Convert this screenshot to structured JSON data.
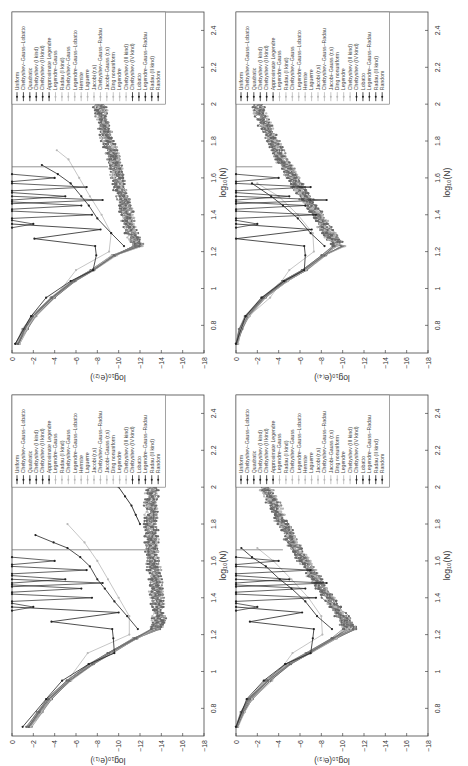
{
  "figure": {
    "orientation": "rotated-90-ccw",
    "panels_layout": "2x2"
  },
  "chart_data": [
    {
      "type": "line",
      "panel": "top-left",
      "title": "",
      "xlabel": "log10(N)",
      "ylabel": "log10(e_(2))",
      "xlim": [
        0.65,
        2.5
      ],
      "ylim": [
        -18,
        0
      ],
      "xticks": [
        0.8,
        1.0,
        1.2,
        1.4,
        1.6,
        1.8,
        2.0,
        2.2,
        2.4
      ],
      "yticks": [
        0,
        -2,
        -4,
        -6,
        -8,
        -10,
        -12,
        -14,
        -16,
        -18
      ],
      "grid": false,
      "legend_position": "upper-left (rotated)",
      "series_groups": {
        "converging": {
          "x": [
            0.7,
            0.78,
            0.85,
            0.95,
            1.04,
            1.1,
            1.18,
            1.23,
            1.3,
            1.4,
            1.5,
            1.6,
            1.7,
            1.8,
            1.9,
            2.0
          ],
          "y": [
            -0.5,
            -1.2,
            -2.0,
            -3.8,
            -5.8,
            -7.6,
            -9.6,
            -11.7,
            -11.2,
            -10.8,
            -10.3,
            -9.9,
            -9.5,
            -9.0,
            -8.5,
            -8.2
          ]
        },
        "unstable_uniform": {
          "x": [
            0.7,
            0.85,
            0.95,
            1.04,
            1.1,
            1.18,
            1.23,
            1.27,
            1.32,
            1.35
          ],
          "y": [
            -0.3,
            -1.8,
            -3.2,
            -5.5,
            -7.6,
            -7.9,
            -7.8,
            -2.1,
            -8.3,
            0
          ]
        },
        "unstable_chebyshev": {
          "x": [
            1.23,
            1.3,
            1.38,
            1.45,
            1.5,
            1.57,
            1.62,
            1.67
          ],
          "y": [
            -10.5,
            -9.3,
            -8.0,
            -7.2,
            -6.5,
            -5.5,
            -4.3,
            -2.8
          ]
        },
        "light_hermite": {
          "x": [
            0.7,
            0.85,
            0.95,
            1.1,
            1.2,
            1.3,
            1.4,
            1.5,
            1.6,
            1.7,
            1.75
          ],
          "y": [
            -0.4,
            -2.3,
            -4.0,
            -6.0,
            -9.1,
            -9.3,
            -8.4,
            -7.3,
            -6.3,
            -5.3,
            -4.2
          ]
        }
      },
      "legend": [
        "Uniform",
        "Chebyshev–Gauss–Lobatto",
        "Quadratic",
        "Chebyshev (I kind)",
        "Chebyshev (II kind)",
        "Approximate Legendre",
        "Legendre–Gauss",
        "Radau (I kind)",
        "Chebyshev–Gauss",
        "Legendre–Gauss–Lobatto",
        "Hermite",
        "Laguerre",
        "Jacobi (r,s)",
        "Chebyshev–Gauss–Radau",
        "Jacobi–Gauss (r,s)",
        "Ding nonuniform",
        "Legendre",
        "Chebyshev (III kind)",
        "Chebyshev (IV kind)",
        "Lobatto",
        "Legendre–Gauss–Radau",
        "Radau (II kind)",
        "Random"
      ]
    },
    {
      "type": "line",
      "panel": "top-right",
      "title": "",
      "xlabel": "log10(N)",
      "ylabel": "log10(e_(4))",
      "xlim": [
        0.65,
        2.5
      ],
      "ylim": [
        -18,
        0
      ],
      "xticks": [
        0.8,
        1.0,
        1.2,
        1.4,
        1.6,
        1.8,
        2.0,
        2.2,
        2.4
      ],
      "yticks": [
        0,
        -2,
        -4,
        -6,
        -8,
        -10,
        -12,
        -14,
        -16,
        -18
      ],
      "grid": false,
      "series_groups": {
        "converging": {
          "x": [
            0.7,
            0.78,
            0.85,
            0.95,
            1.04,
            1.1,
            1.18,
            1.23,
            1.3,
            1.4,
            1.5,
            1.6,
            1.7,
            1.8,
            1.9,
            2.0
          ],
          "y": [
            0,
            -0.4,
            -1.0,
            -2.6,
            -4.6,
            -6.4,
            -8.2,
            -9.6,
            -8.7,
            -7.6,
            -6.4,
            -5.3,
            -4.3,
            -3.4,
            -2.6,
            -2.1
          ]
        },
        "unstable_uniform": {
          "x": [
            0.7,
            0.85,
            0.95,
            1.04,
            1.1,
            1.18,
            1.23,
            1.27,
            1.32,
            1.35
          ],
          "y": [
            0,
            -0.9,
            -2.4,
            -4.5,
            -6.4,
            -6.5,
            -6.4,
            0,
            -7.1,
            0
          ]
        },
        "unstable_chebyshev": {
          "x": [
            1.23,
            1.3,
            1.38,
            1.45,
            1.5,
            1.57
          ],
          "y": [
            -8.3,
            -7.0,
            -5.8,
            -4.4,
            -3.3,
            -1.5
          ]
        },
        "light_hermite": {
          "x": [
            0.7,
            0.85,
            0.95,
            1.1,
            1.2,
            1.3,
            1.4,
            1.5,
            1.57
          ],
          "y": [
            0,
            -1.2,
            -3.2,
            -5.0,
            -7.3,
            -7.2,
            -5.8,
            -4.0,
            -2.0
          ]
        }
      },
      "legend": [
        "Uniform",
        "Chebyshev–Gauss–Lobatto",
        "Quadratic",
        "Chebyshev (I kind)",
        "Chebyshev (II kind)",
        "Approximate Legendre",
        "Legendre–Gauss",
        "Radau (I kind)",
        "Chebyshev–Gauss",
        "Legendre–Gauss–Lobatto",
        "Hermite",
        "Laguerre",
        "Jacobi (r,s)",
        "Chebyshev–Gauss–Radau",
        "Jacobi–Gauss (r,s)",
        "Ding nonuniform",
        "Legendre",
        "Chebyshev (III kind)",
        "Chebyshev (IV kind)",
        "Lobatto",
        "Legendre–Gauss–Radau",
        "Radau (II kind)",
        "Random"
      ]
    },
    {
      "type": "line",
      "panel": "bottom-left",
      "title": "",
      "xlabel": "log10(N)",
      "ylabel": "log10(e_(1))",
      "xlim": [
        0.65,
        2.5
      ],
      "ylim": [
        -18,
        0
      ],
      "xticks": [
        0.8,
        1.0,
        1.2,
        1.4,
        1.6,
        1.8,
        2.0,
        2.2,
        2.4
      ],
      "yticks": [
        0,
        -2,
        -4,
        -6,
        -8,
        -10,
        -12,
        -14,
        -16,
        -18
      ],
      "grid": false,
      "series_groups": {
        "converging": {
          "x": [
            0.7,
            0.78,
            0.85,
            0.95,
            1.04,
            1.1,
            1.18,
            1.23,
            1.3,
            1.4,
            1.5,
            1.6,
            1.7,
            1.8,
            1.9,
            2.0
          ],
          "y": [
            -1.6,
            -2.6,
            -3.5,
            -5.3,
            -7.4,
            -9.2,
            -11.6,
            -13.5,
            -13.8,
            -13.6,
            -13.4,
            -13.2,
            -13.1,
            -13.0,
            -13.0,
            -13.1
          ]
        },
        "unstable_uniform": {
          "x": [
            0.7,
            0.85,
            0.95,
            1.04,
            1.1,
            1.18,
            1.23,
            1.27,
            1.32,
            1.35
          ],
          "y": [
            -1.0,
            -3.2,
            -4.7,
            -7.2,
            -9.6,
            -9.5,
            -9.4,
            -3.7,
            -10.0,
            0
          ]
        },
        "unstable_chebyshev": {
          "x": [
            1.23,
            1.3,
            1.38,
            1.45,
            1.5,
            1.57,
            1.62,
            1.67,
            1.7,
            1.74
          ],
          "y": [
            -11.8,
            -10.8,
            -9.6,
            -8.7,
            -8.0,
            -7.3,
            -6.4,
            -5.2,
            -3.9,
            -2.2
          ]
        },
        "light_hermite": {
          "x": [
            0.7,
            0.85,
            0.95,
            1.1,
            1.2,
            1.3,
            1.4,
            1.5,
            1.6,
            1.7,
            1.8
          ],
          "y": [
            -1.3,
            -3.4,
            -5.2,
            -7.1,
            -11.0,
            -11.0,
            -10.0,
            -9.0,
            -8.0,
            -6.8,
            -5.2
          ]
        },
        "random_rising": {
          "x": [
            1.8,
            1.85,
            1.9,
            1.95,
            2.0
          ],
          "y": [
            -12.0,
            -11.6,
            -11.2,
            -10.6,
            -10.0
          ]
        }
      },
      "legend": [
        "Uniform",
        "Chebyshev–Gauss–Lobatto",
        "Quadratic",
        "Chebyshev (I kind)",
        "Chebyshev (II kind)",
        "Approximate Legendre",
        "Legendre–Gauss",
        "Radau (I kind)",
        "Chebyshev–Gauss",
        "Legendre–Gauss–Lobatto",
        "Hermite",
        "Laguerre",
        "Jacobi (r,s)",
        "Chebyshev–Gauss–Radau",
        "Jacobi–Gauss (r,s)",
        "Ding nonuniform",
        "Legendre",
        "Chebyshev (III kind)",
        "Chebyshev (IV kind)",
        "Lobatto",
        "Legendre–Gauss–Radau",
        "Radau (II kind)",
        "Random"
      ]
    },
    {
      "type": "line",
      "panel": "bottom-right",
      "title": "",
      "xlabel": "log10(N)",
      "ylabel": "log10(e_(3))",
      "xlim": [
        0.65,
        2.5
      ],
      "ylim": [
        -18,
        0
      ],
      "xticks": [
        0.8,
        1.0,
        1.2,
        1.4,
        1.6,
        1.8,
        2.0,
        2.2,
        2.4
      ],
      "yticks": [
        0,
        -2,
        -4,
        -6,
        -8,
        -10,
        -12,
        -14,
        -16,
        -18
      ],
      "grid": false,
      "series_groups": {
        "converging": {
          "x": [
            0.7,
            0.78,
            0.85,
            0.95,
            1.04,
            1.1,
            1.18,
            1.23,
            1.3,
            1.4,
            1.5,
            1.6,
            1.7,
            1.8,
            1.9,
            2.0
          ],
          "y": [
            0,
            -0.6,
            -1.3,
            -3.0,
            -4.9,
            -6.8,
            -9.2,
            -10.7,
            -9.9,
            -8.7,
            -7.5,
            -6.3,
            -5.3,
            -4.4,
            -3.6,
            -2.8
          ]
        },
        "unstable_uniform": {
          "x": [
            0.7,
            0.85,
            0.95,
            1.04,
            1.1,
            1.18,
            1.23,
            1.27,
            1.32,
            1.35
          ],
          "y": [
            0,
            -1.0,
            -2.6,
            -4.6,
            -7.0,
            -7.2,
            -7.3,
            -1.3,
            -6.2,
            0
          ]
        },
        "unstable_chebyshev": {
          "x": [
            1.23,
            1.3,
            1.38,
            1.45,
            1.5,
            1.57,
            1.62,
            1.67
          ],
          "y": [
            -9.0,
            -7.6,
            -6.5,
            -5.2,
            -4.1,
            -2.8,
            -1.5,
            -0.5
          ]
        },
        "light_hermite": {
          "x": [
            0.7,
            0.85,
            0.95,
            1.1,
            1.2,
            1.3,
            1.4,
            1.5,
            1.6,
            1.67
          ],
          "y": [
            0,
            -1.5,
            -3.4,
            -5.3,
            -8.1,
            -8.0,
            -6.8,
            -5.2,
            -3.5,
            -2.0
          ]
        }
      },
      "legend": [
        "Uniform",
        "Chebyshev–Gauss–Lobatto",
        "Quadratic",
        "Chebyshev (I kind)",
        "Chebyshev (II kind)",
        "Approximate Legendre",
        "Legendre–Gauss",
        "Radau (I kind)",
        "Chebyshev–Gauss",
        "Legendre–Gauss–Lobatto",
        "Hermite",
        "Laguerre",
        "Jacobi (r,s)",
        "Chebyshev–Gauss–Radau",
        "Jacobi–Gauss (r,s)",
        "Ding nonuniform",
        "Legendre",
        "Chebyshev (III kind)",
        "Chebyshev (IV kind)",
        "Lobatto",
        "Legendre–Gauss–Radau",
        "Radau (II kind)",
        "Random"
      ]
    }
  ],
  "panels": [
    {
      "id": "p1",
      "frame": {
        "left": 12,
        "top": 12,
        "right": 204,
        "bottom": 353
      },
      "ylabel_text": "log₁₀(e₍₂₎)",
      "xlabel_text": "log₁₀(N)"
    },
    {
      "id": "p2",
      "frame": {
        "left": 236,
        "top": 12,
        "right": 428,
        "bottom": 353
      },
      "ylabel_text": "log₁₀(e₍₄₎)",
      "xlabel_text": "log₁₀(N)"
    },
    {
      "id": "p3",
      "frame": {
        "left": 12,
        "top": 395,
        "right": 204,
        "bottom": 736
      },
      "ylabel_text": "log₁₀(e₍₁₎)",
      "xlabel_text": "log₁₀(N)"
    },
    {
      "id": "p4",
      "frame": {
        "left": 236,
        "top": 395,
        "right": 428,
        "bottom": 736
      },
      "ylabel_text": "log₁₀(e₍₃₎)",
      "xlabel_text": "log₁₀(N)"
    }
  ],
  "colors": {
    "dark": "#222222",
    "mid": "#666666",
    "light": "#b8b8b8",
    "frame": "#444444"
  }
}
